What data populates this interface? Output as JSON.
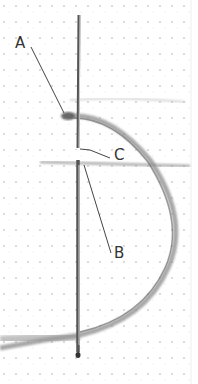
{
  "figure": {
    "labels": [
      {
        "id": "A",
        "text": "A",
        "x": 15,
        "y": 36
      },
      {
        "id": "B",
        "text": "B",
        "x": 114,
        "y": 246
      },
      {
        "id": "C",
        "text": "C",
        "x": 114,
        "y": 148
      }
    ],
    "colors": {
      "background": "#ffffff",
      "fabric_dots": "#c8c8c8",
      "needle": "#555555",
      "thread": "#8a8a8a",
      "leader_line": "#444444"
    }
  }
}
